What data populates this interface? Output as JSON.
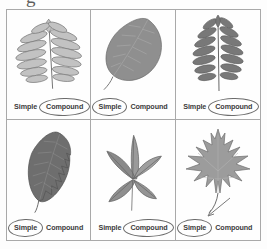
{
  "worksheet": {
    "top_partial_text": "g",
    "option_labels": {
      "simple": "Simple",
      "compound": "Compound"
    },
    "ink_color": "#6b6b6b",
    "text_color": "#3b3b3b",
    "grid_line_color": "#a9a9a9"
  },
  "cells": [
    {
      "position": "row1-col1",
      "leaf_name": "pinnately-compound-sumac-leaf",
      "leaf_description": "Pale gray pinnately compound leaf with many opposite leaflets along a central rachis",
      "leaf_tone": "#b9b9b9",
      "simple_label": "Simple",
      "compound_label": "Compound",
      "selected_answer": "Compound"
    },
    {
      "position": "row1-col2",
      "leaf_name": "simple-ovate-leaf",
      "leaf_description": "Broad simple ovate leaf with a single blade and pinnate venation",
      "leaf_tone": "#8f8f8f",
      "simple_label": "Simple",
      "compound_label": "Compound",
      "selected_answer": "Simple"
    },
    {
      "position": "row1-col3",
      "leaf_name": "pinnately-compound-ash-leaf",
      "leaf_description": "Dark pinnately compound leaf with paired narrow leaflets",
      "leaf_tone": "#7a7a7a",
      "simple_label": "Simple",
      "compound_label": "Compound",
      "selected_answer": "Compound"
    },
    {
      "position": "row2-col1",
      "leaf_name": "simple-serrated-elliptic-leaf",
      "leaf_description": "Dark simple elliptic leaf with finely serrated margins",
      "leaf_tone": "#6e6e6e",
      "simple_label": "Simple",
      "compound_label": "Compound",
      "selected_answer": "Simple"
    },
    {
      "position": "row2-col2",
      "leaf_name": "palmately-compound-creeper-leaf",
      "leaf_description": "Palmately compound leaf with five leaflets radiating from one point",
      "leaf_tone": "#8a8a8a",
      "simple_label": "Simple",
      "compound_label": "Compound",
      "selected_answer": "Compound"
    },
    {
      "position": "row2-col3",
      "leaf_name": "simple-lobed-maple-leaf",
      "leaf_description": "Simple deeply lobed maple leaf on a long petiole",
      "leaf_tone": "#9c9c9c",
      "simple_label": "Simple",
      "compound_label": "Compound",
      "selected_answer": "Simple"
    }
  ]
}
